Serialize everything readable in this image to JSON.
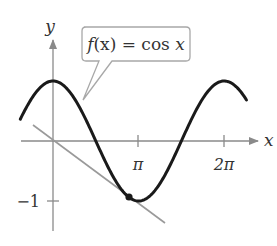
{
  "chart_data": {
    "type": "line",
    "title": "",
    "series": [
      {
        "name": "f(x) = cos x",
        "function": "cos",
        "x_range": [
          -1.2,
          7.1
        ],
        "color": "#1a1a1a"
      },
      {
        "name": "tangent line",
        "function": "linear",
        "points": [
          [
            -0.7,
            0.25
          ],
          [
            3.5,
            -1.38
          ]
        ],
        "color": "#9a9a9a"
      }
    ],
    "marked_point": {
      "x": 2.9,
      "y": -0.97
    },
    "xlabel": "x",
    "ylabel": "y",
    "xticks": [
      {
        "value": 3.14159,
        "label": "π"
      },
      {
        "value": 6.28319,
        "label": "2π"
      }
    ],
    "yticks": [
      {
        "value": -1,
        "label": "−1"
      }
    ],
    "xlim": [
      -1.2,
      7.1
    ],
    "ylim": [
      -1.5,
      1.9
    ],
    "grid": false,
    "annotation": {
      "text": "f(x) = cos x",
      "target_x": 1.31,
      "target_y": 0.73
    }
  },
  "labels": {
    "x_axis": "x",
    "y_axis": "y",
    "tick_pi": "π",
    "tick_2pi": "2π",
    "tick_neg1": "−1",
    "callout_f": "f",
    "callout_rest": "(x) = cos ",
    "callout_x": "x"
  }
}
